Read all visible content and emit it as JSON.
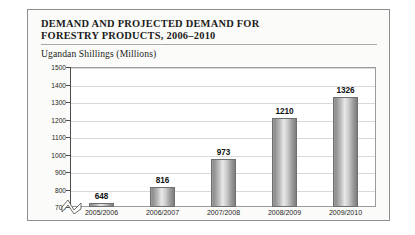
{
  "figure": {
    "title": "DEMAND AND PROJECTED DEMAND FOR\nFORESTRY PRODUCTS, 2006–2010",
    "subtitle": "Ugandan Shillings (Millions)"
  },
  "chart_data": {
    "type": "bar",
    "title": "DEMAND AND PROJECTED DEMAND FOR FORESTRY PRODUCTS, 2006–2010",
    "subtitle": "Ugandan Shillings (Millions)",
    "xlabel": "",
    "ylabel": "Ugandan Shillings (Millions)",
    "categories": [
      "2005/2006",
      "2006/2007",
      "2007/2008",
      "2008/2009",
      "2009/2010"
    ],
    "values": [
      648,
      816,
      973,
      1210,
      1326
    ],
    "value_labels": [
      "648",
      "816",
      "973",
      "1210",
      "1326"
    ],
    "ylim": [
      700,
      1500
    ],
    "ytick_labels": [
      "700",
      "800",
      "900",
      "1000",
      "1100",
      "1200",
      "1300",
      "1400",
      "1500"
    ],
    "yticks": [
      700,
      800,
      900,
      1000,
      1100,
      1200,
      1300,
      1400,
      1500
    ],
    "grid": true,
    "axis_break": true,
    "legend": "none",
    "bar_color": "#b5b5b5",
    "grid_color": "#d9d9d9",
    "axis_color": "#4d4d4d"
  }
}
